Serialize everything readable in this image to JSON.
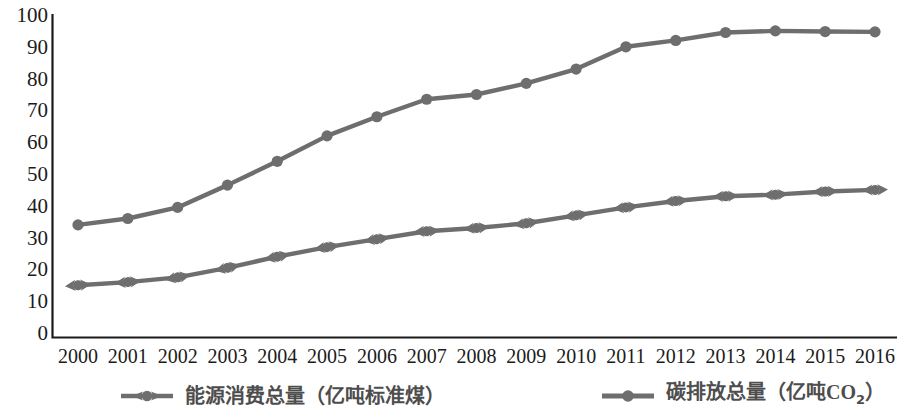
{
  "chart_data": {
    "type": "line",
    "title": "",
    "subtitle": "",
    "xlabel": "",
    "ylabel": "",
    "categories": [
      "2000",
      "2001",
      "2002",
      "2003",
      "2004",
      "2005",
      "2006",
      "2007",
      "2008",
      "2009",
      "2010",
      "2011",
      "2012",
      "2013",
      "2014",
      "2015",
      "2016"
    ],
    "xticklabels": [
      "2000",
      "2001",
      "2002",
      "2003",
      "2004",
      "2005",
      "2006",
      "2007",
      "2008",
      "2009",
      "2010",
      "2011",
      "2012",
      "2013",
      "2014",
      "2015",
      "2016"
    ],
    "yticklabels": [
      "100",
      "90",
      "80",
      "70",
      "60",
      "50",
      "40",
      "30",
      "20",
      "10",
      "0"
    ],
    "ylim": [
      0,
      100
    ],
    "ytick_step": 10,
    "grid": false,
    "legend_position": "bottom",
    "series": [
      {
        "name": "能源消费总量（亿吨标准煤）",
        "name_plain": "能源消费总量（亿吨标准煤）",
        "marker": "circle-with-left-right-arrows",
        "color": "#6e6e6e",
        "values": [
          15,
          16,
          17.5,
          20.5,
          24,
          27,
          29.5,
          32,
          33,
          34.5,
          37,
          39.5,
          41.5,
          43,
          43.5,
          44.5,
          45
        ]
      },
      {
        "name": "碳排放总量（亿吨CO2）",
        "name_plain": "碳排放总量（亿吨CO2）",
        "marker": "circle",
        "color": "#6e6e6e",
        "values": [
          34,
          36,
          39.5,
          46.5,
          54,
          62,
          68,
          73.5,
          75,
          78.5,
          83,
          90,
          92,
          94.5,
          95,
          94.8,
          94.7
        ]
      }
    ]
  },
  "legend": {
    "entries": [
      {
        "marker_name": "legend-marker-energy",
        "label_prefix": "能源消费总量（亿吨标准煤）",
        "label_latin": "",
        "label_sub": "",
        "label_suffix": ""
      },
      {
        "marker_name": "legend-marker-carbon",
        "label_prefix": "碳排放总量（亿吨",
        "label_latin": "CO",
        "label_sub": "2",
        "label_suffix": "）"
      }
    ]
  },
  "axes": {
    "y_axis_name": "y-axis",
    "x_axis_name": "x-axis",
    "y_min_label": "0",
    "y_max_label": "100"
  },
  "colors": {
    "line": "#6e6e6e",
    "axis": "#1a1a1a",
    "text": "#1b1b1b",
    "legend_text": "#4d4d4d",
    "background": "#ffffff"
  }
}
